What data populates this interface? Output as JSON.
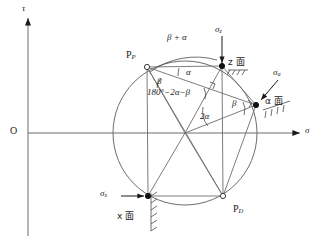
{
  "figure": {
    "type": "mohr-circle-diagram",
    "stroke_color": "#4a4a4a",
    "text_color": "#1a1a1a",
    "background": "#ffffff"
  },
  "axes": {
    "origin_label": "O",
    "vertical_axis_label": "τ",
    "horizontal_axis_label": "σ"
  },
  "points": [
    {
      "id": "pole",
      "label": "P",
      "sub": "P",
      "marker": "open",
      "x": 147,
      "y": 67
    },
    {
      "id": "z_face",
      "label": "",
      "sub": "",
      "marker": "filled",
      "x": 222,
      "y": 66
    },
    {
      "id": "a_face",
      "label": "",
      "sub": "",
      "marker": "filled",
      "x": 256,
      "y": 105
    },
    {
      "id": "pd",
      "label": "P",
      "sub": "D",
      "marker": "open",
      "x": 223,
      "y": 196
    },
    {
      "id": "x_face",
      "label": "",
      "sub": "",
      "marker": "filled",
      "x": 148,
      "y": 196
    }
  ],
  "point_labels": {
    "pole": "P",
    "pole_sub": "P",
    "pd": "P",
    "pd_sub": "D"
  },
  "stress_labels": {
    "sigma_z": "σ",
    "sigma_z_sub": "z",
    "sigma_alpha": "σ",
    "sigma_alpha_sub": "α",
    "sigma_x": "σ",
    "sigma_x_sub": "x"
  },
  "plane_labels": {
    "z_plane": "z 面",
    "alpha_plane": "α 面",
    "x_plane": "x 面"
  },
  "angles": [
    {
      "id": "beta_plus_alpha",
      "text": "β + α",
      "x": 172,
      "y": 39
    },
    {
      "id": "alpha_top",
      "text": "α",
      "x": 188,
      "y": 73
    },
    {
      "id": "beta_pole",
      "text": "β",
      "x": 159,
      "y": 83
    },
    {
      "id": "sum_angle",
      "text": "180°−2α−β",
      "x": 148,
      "y": 95
    },
    {
      "id": "two_alpha",
      "text": "2α",
      "x": 199,
      "y": 117
    },
    {
      "id": "beta_right",
      "text": "β",
      "x": 234,
      "y": 104
    }
  ],
  "geometry": {
    "circle_center_x": 185,
    "circle_center_y": 133,
    "circle_radius": 72,
    "axis_y": 133,
    "axis_x": 28
  }
}
